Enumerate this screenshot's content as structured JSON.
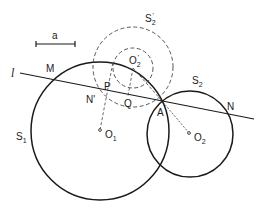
{
  "diagram": {
    "type": "geometric-construction",
    "scale_bar": {
      "label": "a"
    },
    "line": {
      "label": "l"
    },
    "circles": [
      {
        "id": "S1",
        "label": "S",
        "sub": "1",
        "center_label": "O",
        "center_sub": "1",
        "style": "solid"
      },
      {
        "id": "S2",
        "label": "S",
        "sub": "2",
        "center_label": "O",
        "center_sub": "2",
        "style": "solid"
      },
      {
        "id": "S2prime",
        "label": "S",
        "sub": "2",
        "prime": "'",
        "style": "dashed"
      },
      {
        "id": "O2prime-small",
        "center_label": "O",
        "center_sub": "2",
        "center_prime": "'",
        "style": "dashed"
      }
    ],
    "points": {
      "M": "M",
      "N": "N",
      "N_prime": "N'",
      "P": "P",
      "Q": "Q",
      "A": "A"
    }
  }
}
